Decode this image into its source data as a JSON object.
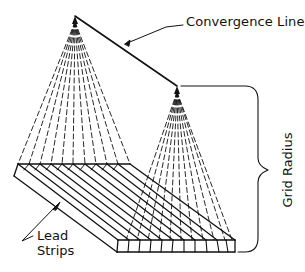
{
  "diagram": {
    "type": "technical-illustration",
    "labels": {
      "convergence_line": "Convergence Line",
      "lead_strips_line1": "Lead",
      "lead_strips_line2": "Strips",
      "grid_radius": "Grid Radius"
    },
    "colors": {
      "line": "#111111",
      "background": "#ffffff"
    },
    "geometry": {
      "fan_large_apex": [
        75,
        16
      ],
      "fan_small_apex": [
        177,
        86
      ],
      "grid_back_edge": [
        [
          18,
          164
        ],
        [
          130,
          164
        ]
      ],
      "grid_front_edge": [
        [
          117,
          252
        ],
        [
          235,
          252
        ]
      ],
      "strip_count": 10,
      "bracket": {
        "top": 86,
        "bottom": 252,
        "x": 258,
        "tip": [
          275,
          170
        ]
      }
    }
  }
}
